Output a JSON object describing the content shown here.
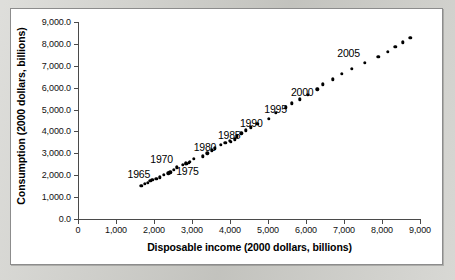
{
  "figure": {
    "background_color": "#cdcdc8",
    "panel_color": "#ffffff",
    "panel_border_color": "#8c8c8c",
    "marker_color": "#000000",
    "axis_color": "#4a4a4a"
  },
  "chart_data": {
    "type": "scatter",
    "title": "",
    "xlabel": "Disposable income (2000 dollars, billions)",
    "ylabel": "Consumption (2000 dollars, billions)",
    "xlim": [
      0,
      9000
    ],
    "ylim": [
      0,
      9000
    ],
    "grid": false,
    "legend": "none",
    "xticks": [
      0,
      1000,
      2000,
      3000,
      4000,
      5000,
      6000,
      7000,
      8000,
      9000
    ],
    "xticklabels": [
      "0",
      "1,000",
      "2,000",
      "3,000",
      "4,000",
      "5,000",
      "6,000",
      "7,000",
      "8,000",
      "9,000"
    ],
    "yticks": [
      0,
      1000,
      2000,
      3000,
      4000,
      5000,
      6000,
      7000,
      8000,
      9000
    ],
    "yticklabels": [
      "0.0",
      "1,000.0",
      "2,000.0",
      "3,000.0",
      "4,000.0",
      "5,000.0",
      "6,000.0",
      "7,000.0",
      "8,000.0",
      "9,000.0"
    ],
    "series": [
      {
        "name": "Consumption vs disposable income",
        "points": [
          {
            "year": 1965,
            "x": 1670,
            "y": 1510
          },
          {
            "year": 1966,
            "x": 1760,
            "y": 1600
          },
          {
            "year": 1967,
            "x": 1830,
            "y": 1650
          },
          {
            "year": 1968,
            "x": 1900,
            "y": 1740
          },
          {
            "year": 1969,
            "x": 1960,
            "y": 1800
          },
          {
            "year": 1970,
            "x": 2060,
            "y": 1850
          },
          {
            "year": 1971,
            "x": 2150,
            "y": 1910
          },
          {
            "year": 1972,
            "x": 2250,
            "y": 2030
          },
          {
            "year": 1973,
            "x": 2400,
            "y": 2120
          },
          {
            "year": 1974,
            "x": 2380,
            "y": 2090
          },
          {
            "year": 1975,
            "x": 2430,
            "y": 2130
          },
          {
            "year": 1976,
            "x": 2520,
            "y": 2250
          },
          {
            "year": 1977,
            "x": 2600,
            "y": 2360
          },
          {
            "year": 1978,
            "x": 2750,
            "y": 2470
          },
          {
            "year": 1979,
            "x": 2830,
            "y": 2540
          },
          {
            "year": 1980,
            "x": 2850,
            "y": 2520
          },
          {
            "year": 1981,
            "x": 2920,
            "y": 2560
          },
          {
            "year": 1982,
            "x": 2950,
            "y": 2600
          },
          {
            "year": 1983,
            "x": 3050,
            "y": 2740
          },
          {
            "year": 1984,
            "x": 3280,
            "y": 2860
          },
          {
            "year": 1985,
            "x": 3400,
            "y": 3000
          },
          {
            "year": 1986,
            "x": 3520,
            "y": 3130
          },
          {
            "year": 1987,
            "x": 3600,
            "y": 3230
          },
          {
            "year": 1988,
            "x": 3760,
            "y": 3380
          },
          {
            "year": 1989,
            "x": 3880,
            "y": 3490
          },
          {
            "year": 1990,
            "x": 4000,
            "y": 3570
          },
          {
            "year": 1991,
            "x": 4020,
            "y": 3540
          },
          {
            "year": 1992,
            "x": 4130,
            "y": 3640
          },
          {
            "year": 1993,
            "x": 4180,
            "y": 3770
          },
          {
            "year": 1994,
            "x": 4300,
            "y": 3920
          },
          {
            "year": 1995,
            "x": 4420,
            "y": 4050
          },
          {
            "year": 1996,
            "x": 4550,
            "y": 4190
          },
          {
            "year": 1997,
            "x": 4720,
            "y": 4340
          },
          {
            "year": 1998,
            "x": 5020,
            "y": 4570
          },
          {
            "year": 1999,
            "x": 5200,
            "y": 4840
          },
          {
            "year": 2000,
            "x": 5470,
            "y": 5100
          },
          {
            "year": 2001,
            "x": 5630,
            "y": 5290
          },
          {
            "year": 2002,
            "x": 5840,
            "y": 5470
          },
          {
            "year": 2003,
            "x": 6040,
            "y": 5680
          },
          {
            "year": 2004,
            "x": 6300,
            "y": 5920
          },
          {
            "year": 2005,
            "x": 6450,
            "y": 6150
          },
          {
            "year": 2006,
            "x": 6700,
            "y": 6380
          },
          {
            "year": 2007,
            "x": 6940,
            "y": 6620
          },
          {
            "year": 2008,
            "x": 7200,
            "y": 6850
          },
          {
            "year": 2009,
            "x": 7550,
            "y": 7130
          },
          {
            "year": 2010,
            "x": 7900,
            "y": 7400
          },
          {
            "year": 2011,
            "x": 8150,
            "y": 7650
          },
          {
            "year": 2012,
            "x": 8350,
            "y": 7880
          },
          {
            "year": 2013,
            "x": 8550,
            "y": 8080
          },
          {
            "year": 2014,
            "x": 8740,
            "y": 8270
          }
        ]
      }
    ],
    "annotations": [
      {
        "label": "1965",
        "x": 1600,
        "y": 2060
      },
      {
        "label": "1970",
        "x": 2200,
        "y": 2740
      },
      {
        "label": "1975",
        "x": 2880,
        "y": 2210
      },
      {
        "label": "1980",
        "x": 3340,
        "y": 3310
      },
      {
        "label": "1985",
        "x": 3980,
        "y": 3850
      },
      {
        "label": "1990",
        "x": 4560,
        "y": 4390
      },
      {
        "label": "1995",
        "x": 5200,
        "y": 5040
      },
      {
        "label": "2000",
        "x": 5900,
        "y": 5780
      },
      {
        "label": "2005",
        "x": 7120,
        "y": 7580
      }
    ]
  }
}
